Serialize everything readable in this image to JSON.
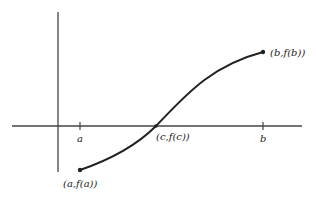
{
  "diagram": {
    "type": "function-graph",
    "colors": {
      "axis": "#444444",
      "curve": "#222222",
      "text": "#222222"
    },
    "x_ticks": [
      {
        "label": "a"
      },
      {
        "label": "b"
      }
    ],
    "points": [
      {
        "id": "start",
        "label": "(a,f(a))"
      },
      {
        "id": "crossing",
        "label": "(c,f(c))"
      },
      {
        "id": "end",
        "label": "(b,f(b))"
      }
    ]
  }
}
